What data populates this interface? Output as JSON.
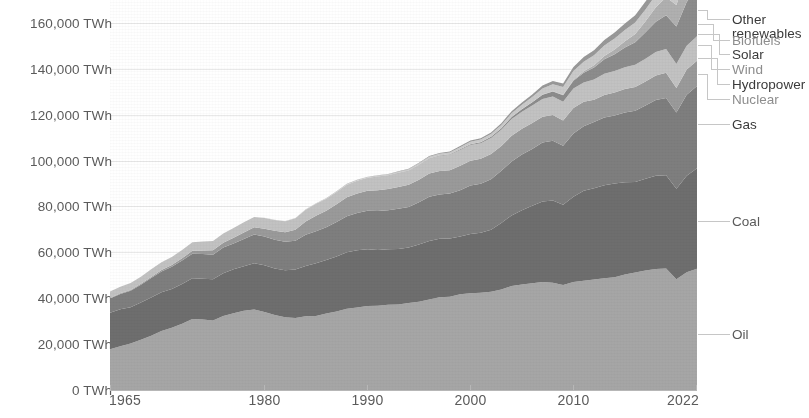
{
  "chart_data": {
    "type": "area",
    "title": "",
    "subtitle": "",
    "xlabel": "",
    "ylabel": "",
    "stacked": true,
    "grid": true,
    "legend_position": "right-direct-labels",
    "xlim": [
      1965,
      2022
    ],
    "ylim": [
      0,
      170000
    ],
    "y_tick_values": [
      0,
      20000,
      40000,
      60000,
      80000,
      100000,
      120000,
      140000,
      160000
    ],
    "y_tick_labels": [
      "0 TWh",
      "20,000 TWh",
      "40,000 TWh",
      "60,000 TWh",
      "80,000 TWh",
      "100,000 TWh",
      "120,000 TWh",
      "140,000 TWh",
      "160,000 TWh"
    ],
    "y_unit": "TWh",
    "x_tick_values": [
      1965,
      1980,
      1990,
      2000,
      2010,
      2022
    ],
    "x_tick_labels": [
      "1965",
      "1980",
      "1990",
      "2000",
      "2010",
      "2022"
    ],
    "x": [
      1965,
      1966,
      1967,
      1968,
      1969,
      1970,
      1971,
      1972,
      1973,
      1974,
      1975,
      1976,
      1977,
      1978,
      1979,
      1980,
      1981,
      1982,
      1983,
      1984,
      1985,
      1986,
      1987,
      1988,
      1989,
      1990,
      1991,
      1992,
      1993,
      1994,
      1995,
      1996,
      1997,
      1998,
      1999,
      2000,
      2001,
      2002,
      2003,
      2004,
      2005,
      2006,
      2007,
      2008,
      2009,
      2010,
      2011,
      2012,
      2013,
      2014,
      2015,
      2016,
      2017,
      2018,
      2019,
      2020,
      2021,
      2022
    ],
    "series": [
      {
        "name": "Oil",
        "color": "#a6a6a6",
        "values": [
          17800,
          19100,
          20300,
          21900,
          23600,
          25700,
          27100,
          28900,
          31000,
          30700,
          30300,
          32300,
          33500,
          34500,
          35100,
          34000,
          32700,
          31700,
          31400,
          32100,
          32300,
          33400,
          34200,
          35400,
          36000,
          36600,
          36700,
          37200,
          37300,
          37900,
          38500,
          39400,
          40400,
          40700,
          41700,
          42200,
          42400,
          42800,
          43800,
          45300,
          46000,
          46500,
          47100,
          46800,
          45800,
          47100,
          47600,
          48200,
          48700,
          49200,
          50400,
          51200,
          52100,
          52700,
          53000,
          48300,
          51300,
          52900
        ]
      },
      {
        "name": "Coal",
        "color": "#6e6e6e",
        "values": [
          15900,
          16100,
          15800,
          16200,
          16700,
          16900,
          16900,
          17300,
          17700,
          17800,
          18000,
          18600,
          19100,
          19400,
          20200,
          20400,
          20300,
          20500,
          21100,
          22000,
          22900,
          23300,
          24000,
          24600,
          24900,
          24800,
          24300,
          24100,
          24200,
          24200,
          24900,
          25500,
          25500,
          25300,
          25200,
          25800,
          26100,
          27000,
          29000,
          30800,
          32400,
          33800,
          35100,
          35800,
          35000,
          37100,
          39200,
          39700,
          40600,
          40800,
          40200,
          39500,
          40000,
          40700,
          40600,
          39400,
          42100,
          43800
        ]
      },
      {
        "name": "Gas",
        "color": "#7e7e7e",
        "values": [
          6200,
          6700,
          7200,
          7800,
          8500,
          9100,
          9700,
          10200,
          10700,
          10800,
          10700,
          11200,
          11300,
          11900,
          12500,
          12500,
          12500,
          12400,
          12600,
          13600,
          14000,
          14200,
          15000,
          15700,
          16300,
          16700,
          17000,
          17100,
          17500,
          17700,
          18400,
          19300,
          19300,
          19600,
          20200,
          21100,
          21400,
          22100,
          22800,
          23500,
          24200,
          24800,
          25700,
          26100,
          25700,
          27600,
          28200,
          28900,
          29500,
          29700,
          30400,
          31000,
          31900,
          33000,
          33700,
          33300,
          35300,
          35800
        ]
      },
      {
        "name": "Nuclear",
        "color": "#9a9a9a",
        "values": [
          200,
          250,
          300,
          400,
          500,
          600,
          800,
          1000,
          1300,
          1500,
          1900,
          2100,
          2500,
          2900,
          3100,
          3400,
          3900,
          4200,
          4800,
          5800,
          6800,
          7200,
          7800,
          8300,
          8500,
          8700,
          9100,
          9200,
          9500,
          9700,
          9900,
          10200,
          10300,
          10200,
          10700,
          10800,
          10900,
          11000,
          10800,
          11200,
          11300,
          11300,
          11200,
          11200,
          11000,
          11100,
          10600,
          9700,
          9800,
          10000,
          10200,
          10400,
          10500,
          10700,
          11000,
          10600,
          11000,
          11000
        ]
      },
      {
        "name": "Hydropower",
        "color": "#c2c2c2",
        "values": [
          2800,
          2900,
          3000,
          3100,
          3300,
          3400,
          3500,
          3600,
          3700,
          3900,
          4000,
          4000,
          4200,
          4400,
          4500,
          4700,
          4700,
          4800,
          5000,
          5100,
          5200,
          5300,
          5300,
          5500,
          5500,
          5700,
          5900,
          5900,
          6100,
          6100,
          6400,
          6500,
          6500,
          6700,
          6800,
          6900,
          6800,
          6900,
          7000,
          7300,
          7400,
          7600,
          7800,
          8000,
          8200,
          8500,
          8400,
          8800,
          9200,
          9300,
          9500,
          9700,
          9900,
          10200,
          10300,
          10500,
          10400,
          10700
        ]
      },
      {
        "name": "Wind",
        "color": "#8c8c8c",
        "values": [
          0,
          0,
          0,
          0,
          0,
          0,
          0,
          0,
          0,
          0,
          0,
          0,
          0,
          0,
          0,
          0,
          0,
          0,
          0,
          0,
          10,
          10,
          20,
          20,
          30,
          40,
          50,
          60,
          80,
          100,
          120,
          140,
          180,
          230,
          300,
          360,
          440,
          540,
          680,
          880,
          1100,
          1400,
          1800,
          2200,
          2800,
          3400,
          4300,
          5300,
          6400,
          7400,
          8600,
          9800,
          11500,
          13200,
          14800,
          16400,
          19000,
          21000
        ]
      },
      {
        "name": "Solar",
        "color": "#b0b0b0",
        "values": [
          0,
          0,
          0,
          0,
          0,
          0,
          0,
          0,
          0,
          0,
          0,
          0,
          0,
          0,
          0,
          0,
          0,
          0,
          0,
          0,
          0,
          0,
          0,
          0,
          0,
          0,
          0,
          0,
          0,
          0,
          0,
          0,
          0,
          0,
          10,
          10,
          20,
          20,
          30,
          40,
          50,
          70,
          100,
          160,
          230,
          340,
          600,
          950,
          1400,
          2000,
          2700,
          3600,
          4800,
          6300,
          7800,
          9300,
          11900,
          14200
        ]
      },
      {
        "name": "Biofuels",
        "color": "#cacaca",
        "values": [
          0,
          0,
          0,
          0,
          0,
          0,
          0,
          0,
          0,
          0,
          0,
          10,
          20,
          30,
          40,
          50,
          70,
          90,
          120,
          160,
          200,
          230,
          260,
          300,
          340,
          380,
          420,
          460,
          500,
          560,
          620,
          680,
          760,
          840,
          920,
          1000,
          1100,
          1220,
          1400,
          1600,
          1850,
          2200,
          2600,
          3000,
          3300,
          3900,
          4200,
          4400,
          4600,
          4800,
          4900,
          5000,
          5200,
          5400,
          5600,
          5200,
          5700,
          6000
        ]
      },
      {
        "name": "Other renewables",
        "color": "#999999",
        "values": [
          0,
          0,
          0,
          0,
          0,
          0,
          0,
          0,
          0,
          0,
          0,
          0,
          0,
          0,
          0,
          0,
          0,
          0,
          0,
          0,
          20,
          30,
          40,
          50,
          60,
          80,
          100,
          130,
          160,
          200,
          250,
          300,
          360,
          420,
          490,
          560,
          630,
          710,
          800,
          900,
          1020,
          1150,
          1300,
          1450,
          1600,
          1800,
          2000,
          2200,
          2400,
          2650,
          2900,
          3150,
          3400,
          3700,
          3950,
          4100,
          4400,
          4600
        ]
      }
    ]
  },
  "axis": {
    "y_labels": [
      {
        "text": "160,000 TWh",
        "value": 160000
      },
      {
        "text": "140,000 TWh",
        "value": 140000
      },
      {
        "text": "120,000 TWh",
        "value": 120000
      },
      {
        "text": "100,000 TWh",
        "value": 100000
      },
      {
        "text": "80,000 TWh",
        "value": 80000
      },
      {
        "text": "60,000 TWh",
        "value": 60000
      },
      {
        "text": "40,000 TWh",
        "value": 40000
      },
      {
        "text": "20,000 TWh",
        "value": 20000
      },
      {
        "text": "0 TWh",
        "value": 0
      }
    ],
    "x_labels": [
      {
        "text": "1965",
        "value": 1965
      },
      {
        "text": "1980",
        "value": 1980
      },
      {
        "text": "1990",
        "value": 1990
      },
      {
        "text": "2000",
        "value": 2000
      },
      {
        "text": "2010",
        "value": 2010
      },
      {
        "text": "2022",
        "value": 2022
      }
    ]
  },
  "legend": {
    "items": [
      {
        "label": "Other renewables",
        "line1": "Other",
        "line2": "renewables",
        "y": 19,
        "color": "#3a3a3a",
        "series": "Other renewables"
      },
      {
        "label": "Biofuels",
        "line1": "Biofuels",
        "line2": "",
        "y": 40,
        "color": "#8d8d8d",
        "series": "Biofuels"
      },
      {
        "label": "Solar",
        "line1": "Solar",
        "line2": "",
        "y": 54,
        "color": "#3a3a3a",
        "series": "Solar"
      },
      {
        "label": "Wind",
        "line1": "Wind",
        "line2": "",
        "y": 69,
        "color": "#8d8d8d",
        "series": "Wind"
      },
      {
        "label": "Hydropower",
        "line1": "Hydropower",
        "line2": "",
        "y": 84,
        "color": "#3a3a3a",
        "series": "Hydropower"
      },
      {
        "label": "Nuclear",
        "line1": "Nuclear",
        "line2": "",
        "y": 99,
        "color": "#8d8d8d",
        "series": "Nuclear"
      },
      {
        "label": "Gas",
        "line1": "Gas",
        "line2": "",
        "y": 124,
        "color": "#3a3a3a",
        "series": "Gas"
      },
      {
        "label": "Coal",
        "line1": "Coal",
        "line2": "",
        "y": 221,
        "color": "#5a5a5a",
        "series": "Coal"
      },
      {
        "label": "Oil",
        "line1": "Oil",
        "line2": "",
        "y": 334,
        "color": "#5a5a5a",
        "series": "Oil"
      }
    ]
  },
  "colors": {
    "axis_text": "#5b5b5b",
    "gridline": "#e9e9e9",
    "background": "#ffffff",
    "connector": "#c6c6c6"
  }
}
